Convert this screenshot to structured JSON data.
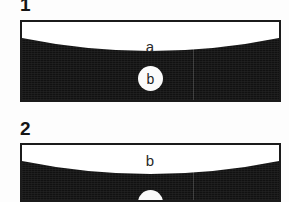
{
  "figure": {
    "background_color": "#fdfdfd",
    "ink_color": "#1b1b1b",
    "dark_fill_color": "#111111",
    "callout_fill_color": "#fbfbfb",
    "panels": [
      {
        "number": "1",
        "band_label": "a",
        "callout_label": "b"
      },
      {
        "number": "2",
        "band_label": "b",
        "callout_label": "c"
      }
    ]
  }
}
